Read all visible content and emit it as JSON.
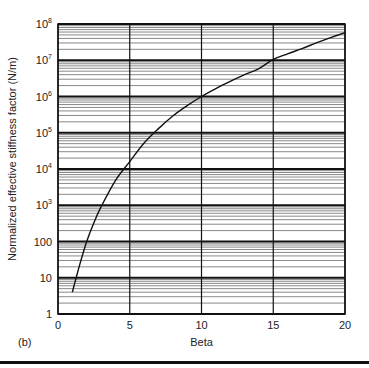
{
  "chart_data": {
    "type": "line",
    "title": "",
    "panel_label": "(b)",
    "xlabel": "Beta",
    "ylabel": "Normalized effective stiffness factor (N/m)",
    "x_scale": "linear",
    "y_scale": "log",
    "xlim": [
      0,
      20
    ],
    "ylim": [
      1,
      100000000
    ],
    "x_ticks": [
      0,
      5,
      10,
      15,
      20
    ],
    "x_tick_labels": [
      "0",
      "5",
      "10",
      "15",
      "20"
    ],
    "y_ticks": [
      1,
      10,
      100,
      1000,
      10000,
      100000,
      1000000,
      10000000,
      100000000
    ],
    "y_tick_labels": [
      {
        "base": "1",
        "exp": ""
      },
      {
        "base": "10",
        "exp": ""
      },
      {
        "base": "100",
        "exp": ""
      },
      {
        "base": "10",
        "exp": "3"
      },
      {
        "base": "10",
        "exp": "4"
      },
      {
        "base": "10",
        "exp": "5"
      },
      {
        "base": "10",
        "exp": "6"
      },
      {
        "base": "10",
        "exp": "7"
      },
      {
        "base": "10",
        "exp": "8"
      }
    ],
    "grid": {
      "major_x": true,
      "major_y": true,
      "minor_y": true
    },
    "legend": "none",
    "series": [
      {
        "name": "stiffness factor",
        "color": "#111111",
        "x": [
          1,
          1.5,
          2,
          2.5,
          3,
          4,
          5,
          6,
          7,
          8,
          9,
          10,
          11,
          12,
          13,
          14,
          15,
          16,
          17,
          18,
          19,
          20
        ],
        "y": [
          4,
          22,
          100,
          330,
          900,
          4800,
          16000,
          52000,
          130000,
          290000,
          560000,
          1000000,
          1650000,
          2600000,
          4000000,
          5900000,
          10500000,
          15000000,
          21000000,
          30000000,
          42000000,
          58000000
        ]
      }
    ]
  },
  "colors": {
    "background": "#ffffff",
    "axis": "#111111",
    "major_grid": "#111111",
    "minor_grid": "#555555",
    "text": "#222222",
    "rule": "#111111"
  }
}
